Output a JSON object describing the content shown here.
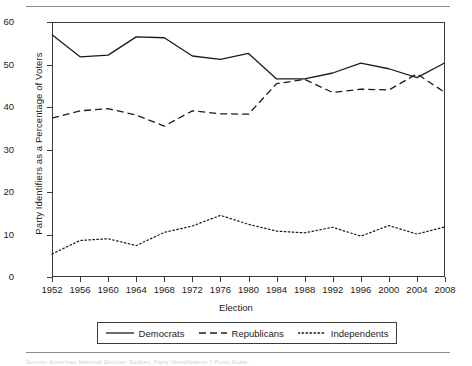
{
  "figure": {
    "top_rule": true,
    "bottom_rule": true,
    "caption_ghost": "Source: American National Election Studies, Party Identification 7-Point Scale."
  },
  "chart_data": {
    "type": "line",
    "title": "",
    "xlabel": "Election",
    "ylabel": "Party Identifiers as a Percentage of Voters",
    "x": [
      1952,
      1956,
      1960,
      1964,
      1968,
      1972,
      1976,
      1980,
      1984,
      1988,
      1992,
      1996,
      2000,
      2004,
      2008
    ],
    "categories": [
      "1952",
      "1956",
      "1960",
      "1964",
      "1968",
      "1972",
      "1976",
      "1980",
      "1984",
      "1988",
      "1992",
      "1996",
      "2000",
      "2004",
      "2008"
    ],
    "xlim": [
      1952,
      2008
    ],
    "ylim": [
      0,
      60
    ],
    "yticks": [
      0,
      10,
      20,
      30,
      40,
      50,
      60
    ],
    "grid": false,
    "legend_position": "below",
    "series": [
      {
        "name": "Democrats",
        "style": "solid",
        "color": "#1b1b1b",
        "values": [
          57.0,
          51.8,
          52.2,
          56.5,
          56.3,
          52.0,
          51.2,
          52.6,
          46.6,
          46.6,
          48.0,
          50.3,
          49.0,
          46.9,
          50.4
        ]
      },
      {
        "name": "Republicans",
        "style": "dashed",
        "color": "#1b1b1b",
        "values": [
          37.4,
          39.1,
          39.6,
          38.1,
          35.5,
          39.1,
          38.4,
          38.3,
          45.5,
          46.5,
          43.4,
          44.2,
          44.0,
          47.8,
          43.4
        ]
      },
      {
        "name": "Independents",
        "style": "dotted",
        "color": "#1b1b1b",
        "values": [
          5.4,
          8.6,
          9.0,
          7.4,
          10.5,
          12.0,
          14.5,
          12.4,
          10.8,
          10.4,
          11.7,
          9.6,
          12.1,
          10.1,
          11.8
        ]
      }
    ]
  },
  "legend": {
    "items": [
      {
        "label": "Democrats",
        "style": "solid"
      },
      {
        "label": "Republicans",
        "style": "dashed"
      },
      {
        "label": "Independents",
        "style": "dotted"
      }
    ]
  }
}
